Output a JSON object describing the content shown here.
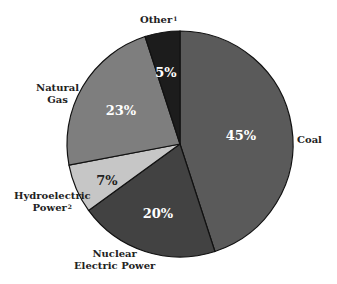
{
  "chart_data": {
    "type": "pie",
    "title": "",
    "start_angle_deg": 0,
    "direction": "clockwise",
    "center": [
      180,
      144
    ],
    "radius": 113,
    "slices": [
      {
        "name": "Coal",
        "label": "Coal",
        "superscript": "",
        "value": 45,
        "display": "45%",
        "color": "#5a5a5a",
        "text_color": "#ffffff",
        "pct_pos": [
          241,
          136
        ],
        "label_pos": [
          298,
          133
        ],
        "label_lines": [
          "Coal"
        ]
      },
      {
        "name": "Nuclear Electric Power",
        "label": "Nuclear Electric Power",
        "superscript": "",
        "value": 20,
        "display": "20%",
        "color": "#424242",
        "text_color": "#ffffff",
        "pct_pos": [
          158,
          214
        ],
        "label_pos": [
          72,
          250
        ],
        "label_lines": [
          "Nuclear",
          "Electric Power"
        ]
      },
      {
        "name": "Hydroelectric Power",
        "label": "Hydroelectric Power",
        "superscript": "2",
        "value": 7,
        "display": "7%",
        "color": "#c6c6c6",
        "text_color": "#222222",
        "pct_pos": [
          106,
          181
        ],
        "label_pos": [
          10,
          191
        ],
        "label_lines": [
          "Hydroelectric",
          "Power"
        ]
      },
      {
        "name": "Natural Gas",
        "label": "Natural Gas",
        "superscript": "",
        "value": 23,
        "display": "23%",
        "color": "#7e7e7e",
        "text_color": "#ffffff",
        "pct_pos": [
          121,
          111
        ],
        "label_pos": [
          38,
          83
        ],
        "label_lines": [
          "Natural",
          "Gas"
        ]
      },
      {
        "name": "Other",
        "label": "Other",
        "superscript": "1",
        "value": 5,
        "display": "5%",
        "color": "#1c1c1c",
        "text_color": "#ffffff",
        "pct_pos": [
          166,
          73
        ],
        "label_pos": [
          140,
          16
        ],
        "label_lines": [
          "Other"
        ]
      }
    ],
    "legend": "none",
    "xlabel": "",
    "ylabel": ""
  },
  "labels": {
    "coal": "Coal",
    "nuclear_line1": "Nuclear",
    "nuclear_line2": "Electric Power",
    "hydro_line1": "Hydroelectric",
    "hydro_line2": "Power",
    "hydro_sup": "2",
    "gas_line1": "Natural",
    "gas_line2": "Gas",
    "other": "Other",
    "other_sup": "1"
  },
  "percents": {
    "coal": "45%",
    "nuclear": "20%",
    "hydro": "7%",
    "gas": "23%",
    "other": "5%"
  }
}
